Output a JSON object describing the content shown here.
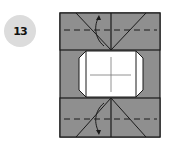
{
  "step": {
    "number": "13"
  },
  "colors": {
    "paper_gray": "#8f8f8f",
    "paper_white": "#ffffff",
    "line": "#1a1a1a",
    "badge": "#dcdcdc"
  },
  "diagram": {
    "arrows": [
      {
        "direction": "up",
        "position": "top-center"
      },
      {
        "direction": "down",
        "position": "bottom-center"
      }
    ]
  }
}
